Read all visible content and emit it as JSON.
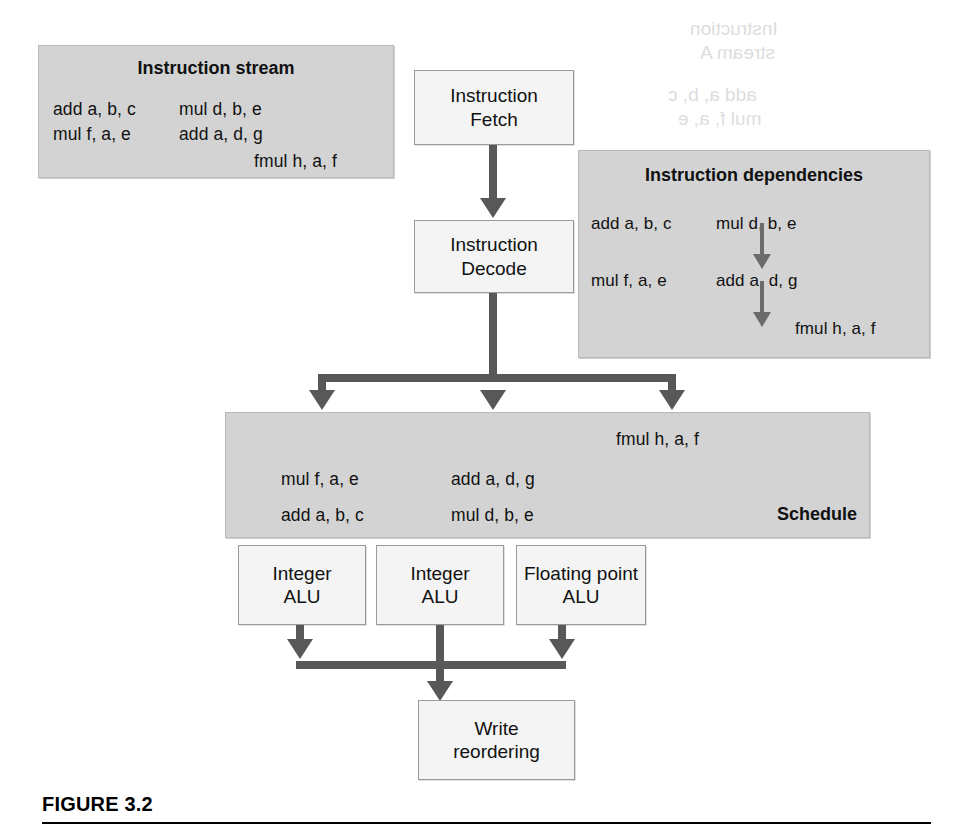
{
  "figure": {
    "caption": "FIGURE 3.2"
  },
  "instruction_stream": {
    "title": "Instruction stream",
    "col1": [
      "add a, b, c",
      "mul f, a, e"
    ],
    "col2": [
      "mul d, b, e",
      "add a, d, g"
    ],
    "trailing": "fmul h, a, f"
  },
  "instruction_dependencies": {
    "title": "Instruction dependencies",
    "col1": [
      "add a, b, c",
      "mul f, a, e"
    ],
    "col2": [
      "mul d, b, e",
      "add a, d, g"
    ],
    "trailing": "fmul h, a, f"
  },
  "pipeline": {
    "fetch": "Instruction\nFetch",
    "fetch_line1": "Instruction",
    "fetch_line2": "Fetch",
    "decode_line1": "Instruction",
    "decode_line2": "Decode",
    "write_line1": "Write",
    "write_line2": "reordering"
  },
  "schedule": {
    "label": "Schedule",
    "top": "fmul h, a, f",
    "col1": [
      "mul f, a, e",
      "add a, b, c"
    ],
    "col2": [
      "add a, d, g",
      "mul d, b, e"
    ]
  },
  "execution_units": [
    {
      "line1": "Integer",
      "line2": "ALU"
    },
    {
      "line1": "Integer",
      "line2": "ALU"
    },
    {
      "line1": "Floating point",
      "line2": "ALU"
    }
  ],
  "colors": {
    "panel_fill": "#d3d3d3",
    "box_fill": "#f4f4f4",
    "connector": "#585858",
    "text": "#111111"
  },
  "bleedthrough": {
    "line1": "Instruction",
    "line2": "stream A",
    "line3": "add a, b, c",
    "line4": "mul f, a, e"
  }
}
